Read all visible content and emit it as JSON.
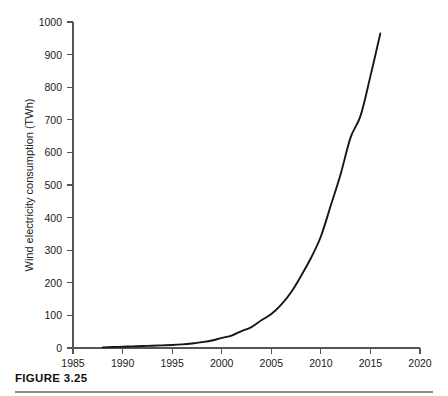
{
  "figure": {
    "caption": "FIGURE 3.25"
  },
  "chart_data": {
    "type": "line",
    "title": "",
    "xlabel": "",
    "ylabel": "Wind electricity consumption (TWh)",
    "xlim": [
      1985,
      2020
    ],
    "ylim": [
      0,
      1000
    ],
    "grid": false,
    "legend": null,
    "x_ticks": [
      1985,
      1990,
      1995,
      2000,
      2005,
      2010,
      2015,
      2020
    ],
    "y_ticks": [
      0,
      100,
      200,
      300,
      400,
      500,
      600,
      700,
      800,
      900,
      1000
    ],
    "series": [
      {
        "name": "Wind electricity consumption",
        "color": "#161616",
        "x": [
          1988,
          1989,
          1990,
          1991,
          1992,
          1993,
          1994,
          1995,
          1996,
          1997,
          1998,
          1999,
          2000,
          2001,
          2002,
          2003,
          2004,
          2005,
          2006,
          2007,
          2008,
          2009,
          2010,
          2011,
          2012,
          2013,
          2014,
          2015,
          2016
        ],
        "values": [
          2,
          3,
          4,
          5,
          6,
          7,
          8,
          9,
          11,
          14,
          18,
          23,
          31,
          38,
          52,
          64,
          85,
          104,
          133,
          171,
          221,
          276,
          342,
          437,
          534,
          646,
          712,
          834,
          965
        ]
      }
    ]
  }
}
